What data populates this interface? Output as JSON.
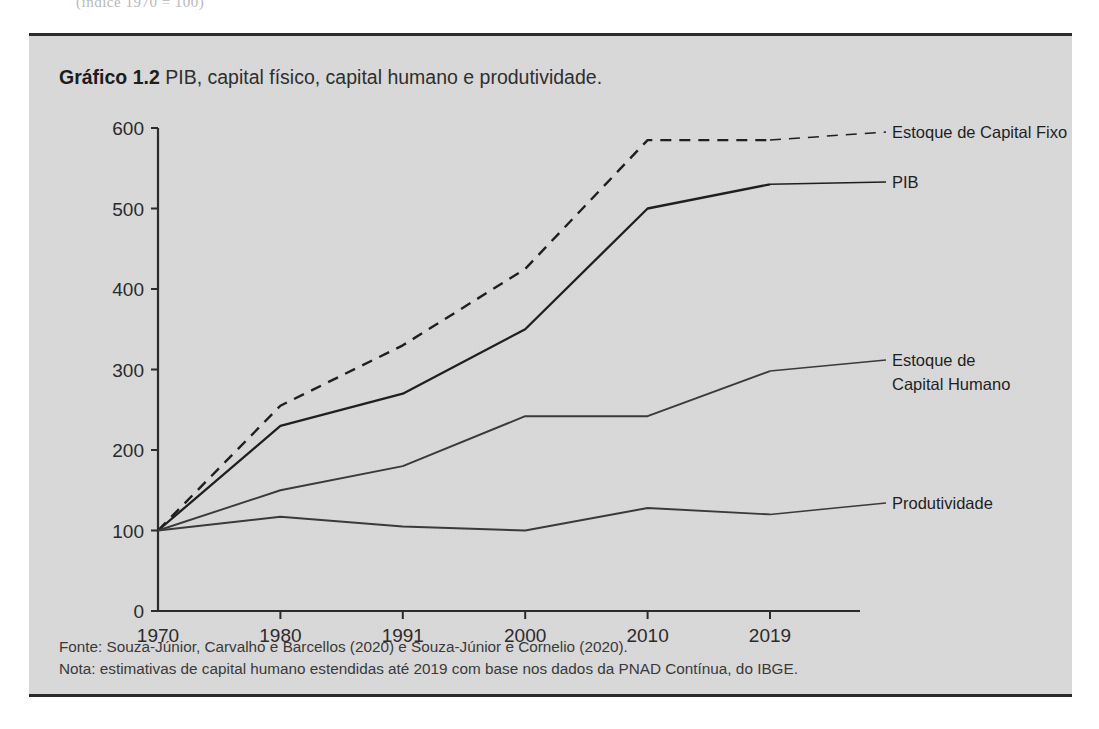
{
  "page": {
    "bleed_text": "(índice 1970 = 100)"
  },
  "figure": {
    "title_bold": "Gráfico 1.2",
    "title_rest": " PIB, capital físico, capital humano e produtividade.",
    "source_note": "Fonte: Souza-Júnior, Carvalho e Barcellos (2020) e Souza-Júnior e Cornelio (2020).",
    "note": "Nota: estimativas de capital humano estendidas até 2019 com base nos dados da PNAD Contínua, do IBGE.",
    "background_color": "#d9d9d9",
    "rule_color": "#2b2b2b"
  },
  "chart_data": {
    "type": "line",
    "title": "Gráfico 1.2 PIB, capital físico, capital humano e produtividade.",
    "xlabel": "",
    "ylabel": "",
    "categories": [
      "1970",
      "1980",
      "1991",
      "2000",
      "2010",
      "2019"
    ],
    "ylim": [
      0,
      600
    ],
    "yticks": [
      0,
      100,
      200,
      300,
      400,
      500,
      600
    ],
    "grid": false,
    "legend_position": "right-inline-labels",
    "series": [
      {
        "name": "Estoque de Capital Fixo",
        "style": "dashed",
        "color": "#1f1f1f",
        "label_lines": [
          "Estoque de Capital Fixo"
        ],
        "values": [
          100,
          255,
          330,
          425,
          585,
          585
        ]
      },
      {
        "name": "PIB",
        "style": "solid",
        "color": "#1f1f1f",
        "label_lines": [
          "PIB"
        ],
        "values": [
          100,
          230,
          270,
          350,
          500,
          530
        ]
      },
      {
        "name": "Estoque de Capital Humano",
        "style": "solid",
        "color": "#3a3a3a",
        "label_lines": [
          "Estoque de",
          "Capital Humano"
        ],
        "values": [
          100,
          150,
          180,
          242,
          242,
          298
        ]
      },
      {
        "name": "Produtividade",
        "style": "solid",
        "color": "#3a3a3a",
        "label_lines": [
          "Produtividade"
        ],
        "values": [
          100,
          117,
          105,
          100,
          128,
          120
        ]
      }
    ]
  }
}
